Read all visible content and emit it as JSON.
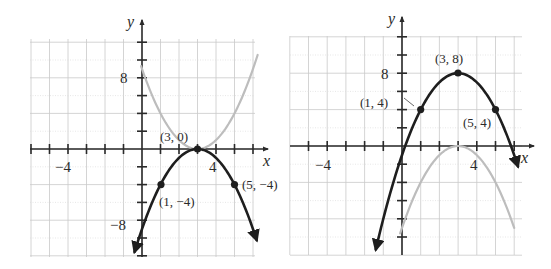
{
  "chart_data": [
    {
      "type": "line",
      "title": "",
      "xlabel": "x",
      "ylabel": "y",
      "xlim": [
        -6,
        6
      ],
      "ylim": [
        -12,
        12
      ],
      "x_tick_labels": [
        "-4",
        "4"
      ],
      "y_tick_labels": [
        "8",
        "-8"
      ],
      "grid": true,
      "series": [
        {
          "name": "y = -(x - 3)^2",
          "style": "black",
          "vertex": [
            3,
            0
          ],
          "opens": "down"
        },
        {
          "name": "y = (x - 3)^2",
          "style": "gray",
          "vertex": [
            3,
            0
          ],
          "opens": "up"
        }
      ],
      "points": [
        {
          "x": 3,
          "y": 0,
          "label": "(3, 0)"
        },
        {
          "x": 1,
          "y": -4,
          "label": "(1, −4)"
        },
        {
          "x": 5,
          "y": -4,
          "label": "(5, −4)"
        }
      ]
    },
    {
      "type": "line",
      "title": "",
      "xlabel": "x",
      "ylabel": "y",
      "xlim": [
        -6,
        6
      ],
      "ylim": [
        -12,
        12
      ],
      "x_tick_labels": [
        "-4",
        "4"
      ],
      "y_tick_labels": [
        "8"
      ],
      "grid": true,
      "series": [
        {
          "name": "y = -(x - 3)^2 + 8",
          "style": "black",
          "vertex": [
            3,
            8
          ],
          "opens": "down"
        },
        {
          "name": "y = -(x - 3)^2",
          "style": "gray",
          "vertex": [
            3,
            0
          ],
          "opens": "down"
        }
      ],
      "points": [
        {
          "x": 3,
          "y": 8,
          "label": "(3, 8)"
        },
        {
          "x": 1,
          "y": 4,
          "label": "(1, 4)"
        },
        {
          "x": 5,
          "y": 4,
          "label": "(5, 4)"
        }
      ]
    }
  ],
  "left_graph": {
    "axis_x": "x",
    "axis_y": "y",
    "tick_x_neg": "−4",
    "tick_x_pos": "4",
    "tick_y_pos": "8",
    "tick_y_neg": "−8",
    "labels": {
      "vertex": "(3, 0)",
      "p1": "(1, −4)",
      "p2": "(5, −4)"
    }
  },
  "right_graph": {
    "axis_x": "x",
    "axis_y": "y",
    "tick_x_neg": "−4",
    "tick_x_pos": "4",
    "tick_y_pos": "8",
    "labels": {
      "vertex": "(3, 8)",
      "p1": "(1, 4)",
      "p2": "(5, 4)"
    }
  },
  "colors": {
    "main_curve": "#1e1e1e",
    "reference_curve": "#bdbdbd",
    "grid": "#c9c9c9"
  }
}
